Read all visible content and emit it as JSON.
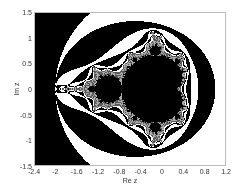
{
  "chart_data": {
    "type": "heatmap",
    "title": "",
    "xlabel": "Re z",
    "ylabel": "Im z",
    "xlim": [
      -2.4,
      1.2
    ],
    "ylim": [
      -1.5,
      1.5
    ],
    "xticks": [
      "-2.4",
      "-2",
      "-1.6",
      "-1.2",
      "-0.8",
      "-0.4",
      "0",
      "0.4",
      "0.8",
      "1.2"
    ],
    "yticks": [
      "1.5",
      "1",
      "0.5",
      "0",
      "-0.5",
      "-1",
      "-1.5"
    ],
    "colormap": [
      "#000000",
      "#ffffff"
    ],
    "grid": false
  }
}
